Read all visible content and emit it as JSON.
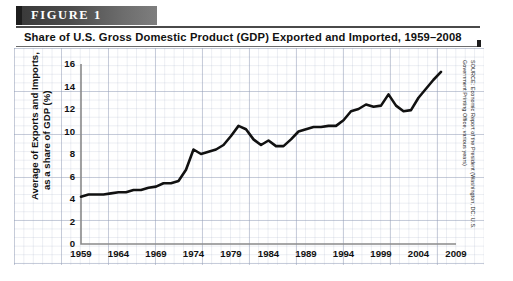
{
  "figure": {
    "banner_label": "FIGURE  1",
    "subtitle": "Share of U.S. Gross Domestic Product (GDP) Exported and Imported, 1959–2008",
    "source_note": "SOURCE: Economic Report of the President (Washington, DC: U.S. Government Printing Office, various years)"
  },
  "chart_data": {
    "type": "line",
    "title": "Share of U.S. Gross Domestic Product (GDP) Exported and Imported, 1959–2008",
    "xlabel": "",
    "ylabel": "Average of Exports and Imports,\nas a share of GDP (%)",
    "ylabel_line1": "Average of Exports and Imports,",
    "ylabel_line2": "as a share of GDP (%)",
    "xlim": [
      1959,
      2009
    ],
    "ylim": [
      0,
      16
    ],
    "ytick_step": 2,
    "xtick_step": 5,
    "grid": true,
    "legend": "none",
    "yticks": [
      "0",
      "2",
      "4",
      "6",
      "8",
      "10",
      "12",
      "14",
      "16"
    ],
    "xticks": [
      "1959",
      "1964",
      "1969",
      "1974",
      "1979",
      "1984",
      "1989",
      "1994",
      "1999",
      "2004",
      "2009"
    ],
    "line_color": "#111111",
    "x": [
      1959,
      1960,
      1961,
      1962,
      1963,
      1964,
      1965,
      1966,
      1967,
      1968,
      1969,
      1970,
      1971,
      1972,
      1973,
      1974,
      1975,
      1976,
      1977,
      1978,
      1979,
      1980,
      1981,
      1982,
      1983,
      1984,
      1985,
      1986,
      1987,
      1988,
      1989,
      1990,
      1991,
      1992,
      1993,
      1994,
      1995,
      1996,
      1997,
      1998,
      1999,
      2000,
      2001,
      2002,
      2003,
      2004,
      2005,
      2006,
      2007
    ],
    "values": [
      4.2,
      4.4,
      4.4,
      4.4,
      4.5,
      4.6,
      4.6,
      4.8,
      4.8,
      5.0,
      5.1,
      5.4,
      5.4,
      5.6,
      6.6,
      8.4,
      8.0,
      8.2,
      8.4,
      8.8,
      9.6,
      10.5,
      10.2,
      9.3,
      8.8,
      9.2,
      8.7,
      8.7,
      9.3,
      10.0,
      10.2,
      10.4,
      10.4,
      10.5,
      10.5,
      11.0,
      11.8,
      12.0,
      12.4,
      12.2,
      12.3,
      13.3,
      12.3,
      11.8,
      11.9,
      13.0,
      13.8,
      14.6,
      15.3
    ]
  }
}
